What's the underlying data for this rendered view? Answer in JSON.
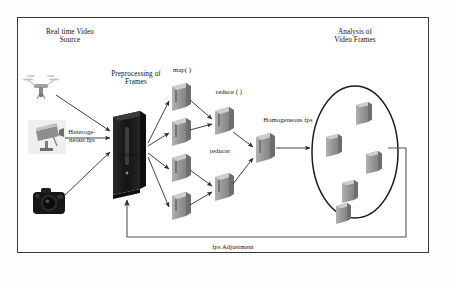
{
  "diagram": {
    "border_color": "#3a3a3a",
    "background": "#ffffff"
  },
  "labels": {
    "source_heading": "Real time Video\nSource",
    "heterogeneous_fps": "Heteroge-\nneous fps",
    "preprocessing": "Preprocessing of\nFrames",
    "mapper": "mapper",
    "map_fn": "map( )",
    "reducer": "reducer",
    "reduce_fn": "reduce ( )",
    "homogeneous_fps": "Homogeneous fps",
    "analysis_heading": "Analysis of\nVideo Frames",
    "fps_adjustment": "fps Adjustment"
  },
  "sources": [
    {
      "name": "drone-icon",
      "label": "drone"
    },
    {
      "name": "cctv-camera-icon",
      "label": "cctv camera"
    },
    {
      "name": "dslr-camera-icon",
      "label": "dslr camera"
    }
  ],
  "nodes": {
    "preprocessing_server": {
      "name": "preprocessing-server",
      "count": 1
    },
    "mappers": {
      "name": "mapper-server",
      "count": 4
    },
    "reducers": {
      "name": "reducer-server",
      "count": 2
    },
    "aggregator": {
      "name": "aggregator-server",
      "count": 1
    },
    "analysis_servers": {
      "name": "analysis-server",
      "count": 5
    }
  },
  "colors": {
    "server_front": "#9a9a9a",
    "server_top": "#c8c8c8",
    "server_side": "#6f6f6f",
    "tower_body": "#1b1b1b",
    "arrow": "#2b2b2b",
    "ellipse_stroke": "#1c1c1c",
    "feedback_line": "#555555"
  }
}
